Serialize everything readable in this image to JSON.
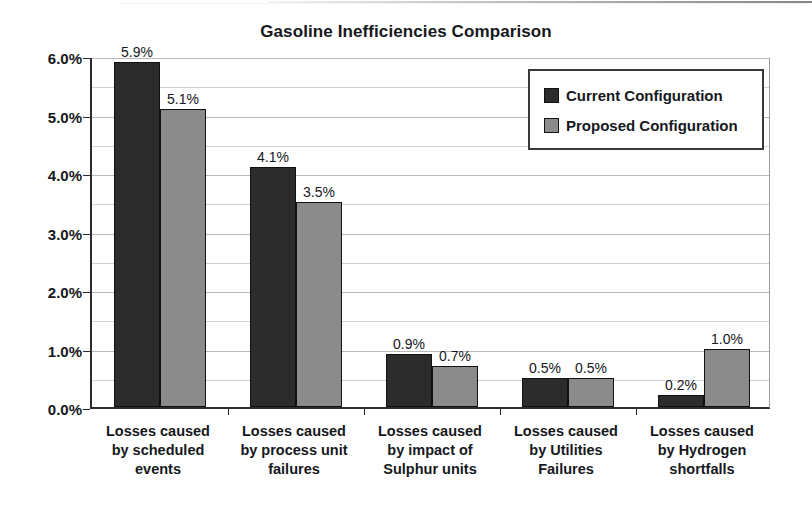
{
  "chart_data": {
    "type": "bar",
    "title": "Gasoline Inefficiencies Comparison",
    "xlabel": "",
    "ylabel": "",
    "ylim": [
      0,
      6
    ],
    "ytick_labels": [
      "0.0%",
      "1.0%",
      "2.0%",
      "3.0%",
      "4.0%",
      "5.0%",
      "6.0%"
    ],
    "ytick_values": [
      0,
      1,
      2,
      3,
      4,
      5,
      6
    ],
    "minor_gridlines": [
      0.5,
      1.5,
      2.5,
      3.5,
      4.5,
      5.5
    ],
    "grid": true,
    "legend_position": "upper-right-inside",
    "categories": [
      "Losses caused by scheduled events",
      "Losses caused by process unit failures",
      "Losses caused by impact of Sulphur units",
      "Losses caused by Utilities Failures",
      "Losses caused by Hydrogen shortfalls"
    ],
    "category_lines": [
      [
        "Losses caused",
        "by scheduled",
        "events"
      ],
      [
        "Losses caused",
        "by process unit",
        "failures"
      ],
      [
        "Losses caused",
        "by impact of",
        "Sulphur units"
      ],
      [
        "Losses caused",
        "by Utilities",
        "Failures"
      ],
      [
        "Losses caused",
        "by Hydrogen",
        "shortfalls"
      ]
    ],
    "series": [
      {
        "name": "Current Configuration",
        "color": "#2c2c2c",
        "values": [
          5.9,
          4.1,
          0.9,
          0.5,
          0.2
        ],
        "labels": [
          "5.9%",
          "4.1%",
          "0.9%",
          "0.5%",
          "0.2%"
        ]
      },
      {
        "name": "Proposed Configuration",
        "color": "#8b8b8b",
        "values": [
          5.1,
          3.5,
          0.7,
          0.5,
          1.0
        ],
        "labels": [
          "5.1%",
          "3.5%",
          "0.7%",
          "0.5%",
          "1.0%"
        ]
      }
    ]
  },
  "legend": {
    "items": [
      {
        "label": "Current Configuration",
        "swatch": "current"
      },
      {
        "label": "Proposed Configuration",
        "swatch": "proposed"
      }
    ]
  }
}
